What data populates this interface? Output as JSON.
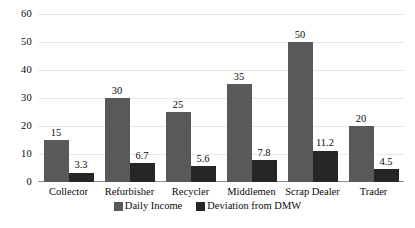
{
  "chart_data": {
    "type": "bar",
    "title": "",
    "subtitle": "",
    "xlabel": "",
    "ylabel": "",
    "ylim": [
      0,
      60
    ],
    "yticks": [
      0,
      10,
      20,
      30,
      40,
      50,
      60
    ],
    "grid": true,
    "legend_position": "bottom-center",
    "categories": [
      "Collector",
      "Refurbisher",
      "Recycler",
      "Middlemen",
      "Scrap Dealer",
      "Trader"
    ],
    "series": [
      {
        "name": "Daily Income",
        "color": "#595959",
        "values": [
          15,
          30,
          25,
          35,
          50,
          20
        ],
        "labels": [
          "15",
          "30",
          "25",
          "35",
          "50",
          "20"
        ]
      },
      {
        "name": "Deviation from DMW",
        "color": "#262626",
        "values": [
          3.3,
          6.7,
          5.6,
          7.8,
          11.2,
          4.5
        ],
        "labels": [
          "3.3",
          "6.7",
          "5.6",
          "7.8",
          "11.2",
          "4.5"
        ]
      }
    ]
  }
}
